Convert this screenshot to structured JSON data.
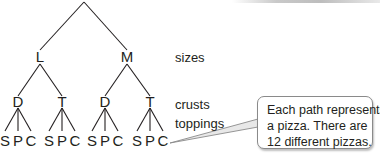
{
  "tree": {
    "levels": [
      {
        "name": "sizes",
        "nodes": [
          "L",
          "M"
        ]
      },
      {
        "name": "crusts",
        "nodes": [
          "D",
          "T",
          "D",
          "T"
        ]
      },
      {
        "name": "toppings",
        "nodes": [
          "S",
          "P",
          "C",
          "S",
          "P",
          "C",
          "S",
          "P",
          "C",
          "S",
          "P",
          "C"
        ]
      }
    ]
  },
  "labels": {
    "sizes": "sizes",
    "crusts": "crusts",
    "toppings": "toppings"
  },
  "callout": {
    "lines": [
      "Each path represents",
      "a pizza. There are",
      "12 different pizzas."
    ]
  },
  "nodes": {
    "size_0": "L",
    "size_1": "M",
    "crust_0": "D",
    "crust_1": "T",
    "crust_2": "D",
    "crust_3": "T",
    "top_0": "S",
    "top_1": "P",
    "top_2": "C",
    "top_3": "S",
    "top_4": "P",
    "top_5": "C",
    "top_6": "S",
    "top_7": "P",
    "top_8": "C",
    "top_9": "S",
    "top_10": "P",
    "top_11": "C"
  },
  "colors": {
    "ink": "#231f20",
    "callout_border": "#8a8a8a"
  }
}
